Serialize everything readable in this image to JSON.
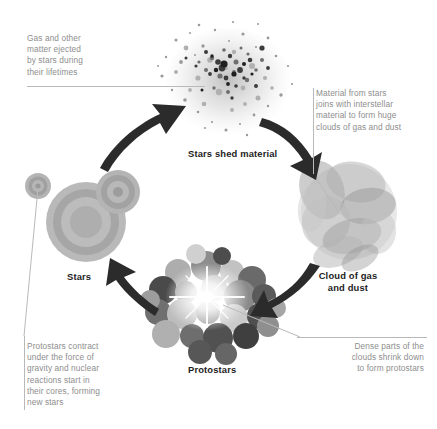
{
  "diagram": {
    "background_color": "#ffffff",
    "caption_color": "#8e8e8e",
    "label_color": "#1d1d1d",
    "leader_color": "#b9b9b9"
  },
  "captions": {
    "ejected_matter": "Gas and other\nmatter ejected\nby stars during\ntheir lifetimes",
    "interstellar": "Material from stars\njoins with interstellar\nmaterial to form huge\nclouds of gas and dust",
    "dense_parts": "Dense parts of the\nclouds shrink down\nto form protostars",
    "protostars_contract": "Protostars contract\nunder the force of\ngravity and nuclear\nreactions start in\ntheir cores, forming\nnew stars"
  },
  "stages": {
    "shed": "Stars shed material",
    "stars": "Stars",
    "protostars": "Protostars",
    "cloud": "Cloud of gas\nand dust"
  },
  "arrows": [
    {
      "name": "stars-to-shed",
      "direction": "up-right"
    },
    {
      "name": "shed-to-cloud",
      "direction": "down-right"
    },
    {
      "name": "cloud-to-protostars",
      "direction": "down-left"
    },
    {
      "name": "protostars-to-stars",
      "direction": "up-left"
    }
  ]
}
